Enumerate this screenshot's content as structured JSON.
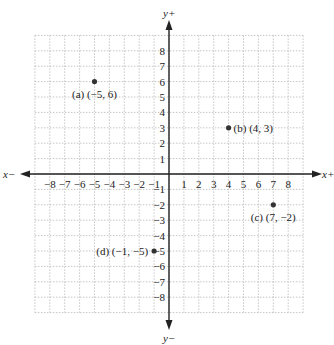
{
  "chart_data": {
    "type": "scatter",
    "title": "",
    "xlabel_pos": "x+",
    "xlabel_neg": "x−",
    "ylabel_pos": "y+",
    "ylabel_neg": "y−",
    "xlim": [
      -9,
      9
    ],
    "ylim": [
      -9,
      9
    ],
    "grid": true,
    "x_ticks": [
      -8,
      -7,
      -6,
      -5,
      -4,
      -3,
      -2,
      -1,
      1,
      2,
      3,
      4,
      5,
      6,
      7,
      8
    ],
    "y_ticks": [
      8,
      7,
      6,
      5,
      4,
      3,
      2,
      1,
      -1,
      -2,
      -3,
      -4,
      -5,
      -6,
      -7,
      -8
    ],
    "points": [
      {
        "id": "a",
        "x": -5,
        "y": 6,
        "label": "(a) (−5, 6)"
      },
      {
        "id": "b",
        "x": 4,
        "y": 3,
        "label": "(b) (4, 3)"
      },
      {
        "id": "c",
        "x": 7,
        "y": -2,
        "label": "(c) (7, −2)"
      },
      {
        "id": "d",
        "x": -1,
        "y": -5,
        "label": "(d) (−1, −5)"
      }
    ]
  },
  "colors": {
    "axis": "#222222",
    "grid": "#b8b8b8",
    "point": "#333333"
  }
}
